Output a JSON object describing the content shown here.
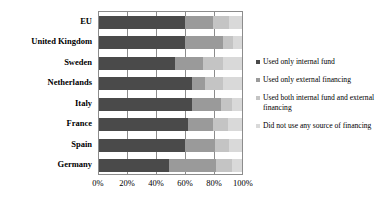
{
  "chart_data": {
    "type": "bar",
    "orientation": "horizontal",
    "stacked": true,
    "normalized": "100%",
    "title": "",
    "xlabel": "",
    "ylabel": "",
    "xlim": [
      0,
      100
    ],
    "xticks": [
      "0%",
      "20%",
      "40%",
      "60%",
      "80%",
      "100%"
    ],
    "xtick_values": [
      0,
      20,
      40,
      60,
      80,
      100
    ],
    "grid": true,
    "grid_axis": "x",
    "legend_position": "right",
    "categories": [
      "EU",
      "United Kingdom",
      "Sweden",
      "Netherlands",
      "Italy",
      "France",
      "Spain",
      "Germany"
    ],
    "series": [
      {
        "name": "Used only internal fund",
        "color": "#4a4a4a",
        "values": [
          60,
          60,
          53,
          65,
          65,
          62,
          60,
          49
        ]
      },
      {
        "name": "Used only external financing",
        "color": "#9a9a9a",
        "values": [
          20,
          27,
          20,
          9,
          20,
          18,
          21,
          33
        ]
      },
      {
        "name": "Used both internal fund and external financing",
        "color": "#c4c4c4",
        "values": [
          11,
          7,
          14,
          13,
          8,
          10,
          10,
          11
        ]
      },
      {
        "name": "Did not use any source of financing",
        "color": "#d9d9d9",
        "values": [
          9,
          6,
          13,
          13,
          7,
          10,
          9,
          7
        ]
      }
    ]
  },
  "axis": {
    "plot_border_color": "#8c8c8c",
    "gridline_color": "#8c8c8c"
  }
}
